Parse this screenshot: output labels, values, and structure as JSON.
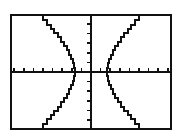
{
  "screen": {
    "kind": "graphing-calculator-plot",
    "background_color": "#ffffff",
    "frame_color": "#111111",
    "frame_border_px": 2,
    "ink_color": "#111111",
    "frame": {
      "x": 10,
      "y": 14,
      "width": 162,
      "height": 116
    }
  },
  "chart_data": {
    "type": "line",
    "title": "",
    "subtitle": "",
    "xlabel": "",
    "ylabel": "",
    "grid": false,
    "legend": null,
    "legend_position": "none",
    "annotations": [],
    "tick_labels": {
      "x": [],
      "y": []
    },
    "axes": {
      "x_axis_pixel_y": 58,
      "y_axis_pixel_x": 83,
      "x_tick_count": 20,
      "y_tick_count": 12,
      "x_tick_spacing_px": 9.6,
      "y_tick_spacing_px": 9.6,
      "x_tick_length_px": 4,
      "y_tick_length_px": 4,
      "x_tick_direction": "up",
      "y_tick_direction": "left"
    },
    "xlim": [
      -10,
      10
    ],
    "ylim": [
      -6.2,
      6.2
    ],
    "curve_name": "hyperbola",
    "equation": "x^2/a^2 - y^2/b^2 = 1",
    "a": 2,
    "b": 3,
    "vertices": [
      [
        -2,
        0
      ],
      [
        2,
        0
      ]
    ],
    "series": [
      {
        "name": "left-branch-upper",
        "points": [
          [
            -2,
            0
          ],
          [
            -2.05,
            0.47
          ],
          [
            -2.15,
            0.96
          ],
          [
            -2.3,
            1.44
          ],
          [
            -2.5,
            1.92
          ],
          [
            -2.75,
            2.4
          ],
          [
            -3.05,
            2.88
          ],
          [
            -3.4,
            3.36
          ],
          [
            -3.8,
            3.84
          ],
          [
            -4.2,
            4.3
          ],
          [
            -4.65,
            4.8
          ],
          [
            -5.1,
            5.25
          ],
          [
            -5.6,
            5.72
          ],
          [
            -6.05,
            6.2
          ]
        ]
      },
      {
        "name": "left-branch-lower",
        "points": [
          [
            -2,
            0
          ],
          [
            -2.05,
            -0.47
          ],
          [
            -2.15,
            -0.96
          ],
          [
            -2.3,
            -1.44
          ],
          [
            -2.5,
            -1.92
          ],
          [
            -2.75,
            -2.4
          ],
          [
            -3.05,
            -2.88
          ],
          [
            -3.4,
            -3.36
          ],
          [
            -3.8,
            -3.84
          ],
          [
            -4.2,
            -4.3
          ],
          [
            -4.65,
            -4.8
          ],
          [
            -5.1,
            -5.25
          ],
          [
            -5.6,
            -5.72
          ],
          [
            -6.05,
            -6.2
          ]
        ]
      },
      {
        "name": "right-branch-upper",
        "points": [
          [
            2,
            0
          ],
          [
            2.05,
            0.47
          ],
          [
            2.15,
            0.96
          ],
          [
            2.3,
            1.44
          ],
          [
            2.5,
            1.92
          ],
          [
            2.75,
            2.4
          ],
          [
            3.05,
            2.88
          ],
          [
            3.4,
            3.36
          ],
          [
            3.8,
            3.84
          ],
          [
            4.2,
            4.3
          ],
          [
            4.65,
            4.8
          ],
          [
            5.1,
            5.25
          ],
          [
            5.6,
            5.72
          ],
          [
            6.05,
            6.2
          ]
        ]
      },
      {
        "name": "right-branch-lower",
        "points": [
          [
            2,
            0
          ],
          [
            2.05,
            -0.47
          ],
          [
            2.15,
            -0.96
          ],
          [
            2.3,
            -1.44
          ],
          [
            2.5,
            -1.92
          ],
          [
            2.75,
            -2.4
          ],
          [
            3.05,
            -2.88
          ],
          [
            3.4,
            -3.36
          ],
          [
            3.8,
            -3.84
          ],
          [
            4.2,
            -4.3
          ],
          [
            4.65,
            -4.8
          ],
          [
            5.1,
            -5.25
          ],
          [
            5.6,
            -5.72
          ],
          [
            6.05,
            -6.2
          ]
        ]
      }
    ]
  }
}
